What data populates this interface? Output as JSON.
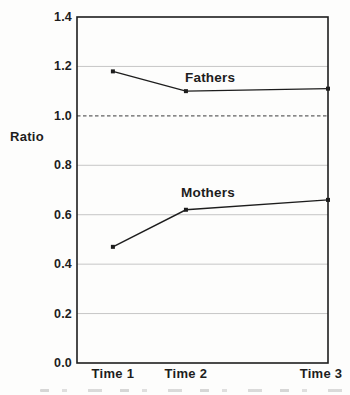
{
  "chart_data": {
    "type": "line",
    "categories": [
      "Time 1",
      "Time 2",
      "Time 3"
    ],
    "series": [
      {
        "name": "Fathers",
        "values": [
          1.18,
          1.1,
          1.11
        ]
      },
      {
        "name": "Mothers",
        "values": [
          0.47,
          0.62,
          0.66
        ]
      }
    ],
    "title": "",
    "xlabel": "",
    "ylabel": "Ratio",
    "ylim": [
      0.0,
      1.4
    ],
    "yticks": [
      0.0,
      0.2,
      0.4,
      0.6,
      0.8,
      1.0,
      1.2,
      1.4
    ],
    "ytick_labels": [
      "0.0",
      "0.2",
      "0.4",
      "0.6",
      "0.8",
      "1.0",
      "1.2",
      "1.4"
    ],
    "reference_line_y": 1.0,
    "reference_line_style": "dashed",
    "grid": true,
    "legend": "inline-series-labels",
    "x_fractions": [
      0.143,
      0.434,
      1.0
    ],
    "marker": "square",
    "colors": {
      "ink": "#1d1d1d",
      "grid": "#c6c6c6",
      "reference": "#616161",
      "background": "#fdfdfc"
    }
  }
}
